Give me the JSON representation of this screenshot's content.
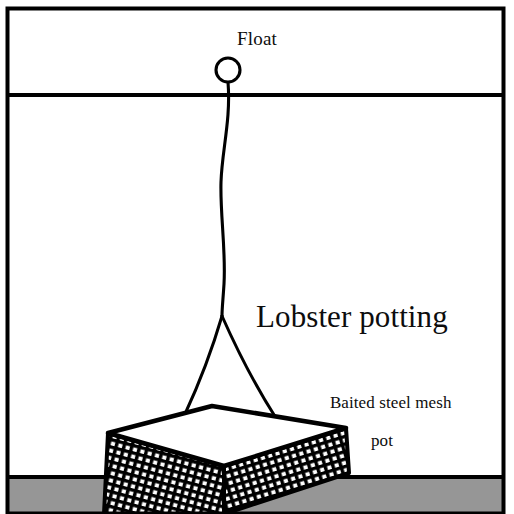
{
  "diagram": {
    "title": "Lobster potting",
    "labels": {
      "float": "Float",
      "pot_line1": "Baited steel mesh",
      "pot_line2": "pot"
    },
    "scene": {
      "sky_region_label": "above-water",
      "water_region_label": "water-column",
      "seabed_label": "seabed"
    },
    "colors": {
      "ink": "#000000",
      "text": "#0d0d0d",
      "background": "#ffffff",
      "seabed": "#969696",
      "mesh_fill": "#000000",
      "mesh_hole": "#ffffff",
      "pot_top": "#ffffff"
    },
    "geometry": {
      "frame": {
        "x": 6,
        "y": 7,
        "width": 499,
        "height": 506
      },
      "waterline_y": 95,
      "seabed_y": 477,
      "float": {
        "cx": 228,
        "cy": 70,
        "r": 12
      },
      "bridle_apex": {
        "x": 222,
        "y": 316
      },
      "pot_top_corners": {
        "back": {
          "x": 212,
          "y": 406
        },
        "left": {
          "x": 108,
          "y": 433
        },
        "front": {
          "x": 224,
          "y": 466
        },
        "right": {
          "x": 346,
          "y": 428
        }
      },
      "pot_depth_px": 60
    }
  }
}
